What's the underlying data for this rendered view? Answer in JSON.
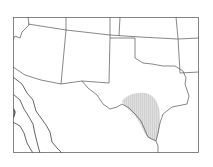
{
  "map": {
    "title": "Range map — Texas and surrounding region",
    "region": "Southwestern United States and northern Mexico",
    "highlighted_area": "South-central Texas",
    "colors": {
      "background": "#ffffff",
      "border": "#555555",
      "range_fill": "#d8d8d8"
    }
  }
}
